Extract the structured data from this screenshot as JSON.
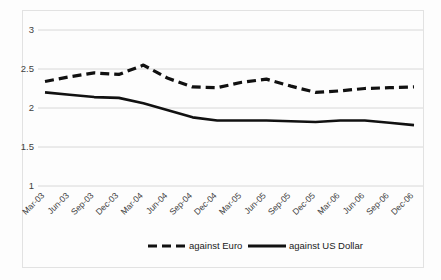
{
  "chart_data": {
    "type": "line",
    "title": "",
    "subtitle": "",
    "xlabel": "",
    "ylabel": "",
    "ylim": [
      1,
      3
    ],
    "yticks": [
      "1",
      "1.5",
      "2",
      "2.5",
      "3"
    ],
    "ytick_values": [
      1,
      1.5,
      2,
      2.5,
      3
    ],
    "grid": true,
    "legend_position": "bottom",
    "categories": [
      "Mar-03",
      "Jun-03",
      "Sep-03",
      "Dec-03",
      "Mar-04",
      "Jun-04",
      "Sep-04",
      "Dec-04",
      "Mar-05",
      "Jun-05",
      "Sep-05",
      "Dec-05",
      "Mar-06",
      "Jun-06",
      "Sep-06",
      "Dec-06"
    ],
    "series": [
      {
        "name": "against Euro",
        "style": "dashed",
        "color": "#111111",
        "values": [
          2.34,
          2.4,
          2.45,
          2.43,
          2.55,
          2.38,
          2.27,
          2.26,
          2.33,
          2.37,
          2.28,
          2.2,
          2.22,
          2.25,
          2.26,
          2.27
        ]
      },
      {
        "name": "against US Dollar",
        "style": "solid",
        "color": "#111111",
        "values": [
          2.2,
          2.17,
          2.14,
          2.13,
          2.06,
          1.97,
          1.88,
          1.84,
          1.84,
          1.84,
          1.83,
          1.82,
          1.84,
          1.84,
          1.81,
          1.78
        ]
      }
    ]
  },
  "legend": {
    "items": [
      {
        "label": "against Euro",
        "style": "dashed"
      },
      {
        "label": "against US Dollar",
        "style": "solid"
      }
    ]
  }
}
